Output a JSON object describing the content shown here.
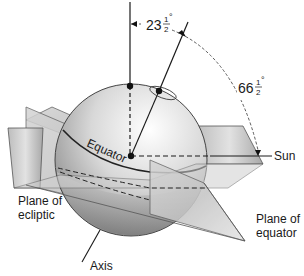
{
  "diagram": {
    "labels": {
      "angle_small_whole": "23",
      "angle_small_num": "1",
      "angle_small_den": "2",
      "angle_large_whole": "66",
      "angle_large_num": "1",
      "angle_large_den": "2",
      "degree": "°",
      "equator": "Equator",
      "sun": "Sun",
      "plane_ecliptic_line1": "Plane of",
      "plane_ecliptic_line2": "ecliptic",
      "plane_equator_line1": "Plane of",
      "plane_equator_line2": "equator",
      "axis": "Axis"
    },
    "colors": {
      "line": "#1a1a1a",
      "sphere_light": "#f4f4f4",
      "sphere_dark": "#8a8a8a",
      "plane_light": "#e6e6e6",
      "plane_dark": "#9a9a9a"
    }
  }
}
